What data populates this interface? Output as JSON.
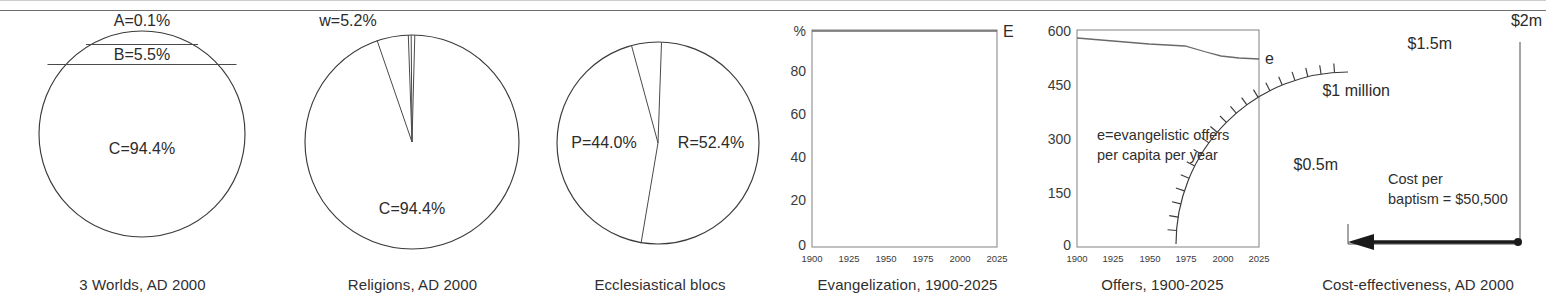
{
  "page": {
    "background": "#ffffff",
    "rule_color": "#6d6d6d",
    "ink_color": "#2b2b2b"
  },
  "panels": [
    {
      "id": "three-worlds",
      "caption": "3 Worlds, AD 2000",
      "labels": {
        "a": "A=0.1%",
        "b": "B=5.5%",
        "c": "C=94.4%"
      }
    },
    {
      "id": "religions",
      "caption": "Religions, AD 2000",
      "labels": {
        "w": "w=5.2%",
        "c": "C=94.4%"
      }
    },
    {
      "id": "ecclesiastical-blocs",
      "caption": "Ecclesiastical blocs",
      "labels": {
        "p": "P=44.0%",
        "r": "R=52.4%"
      }
    },
    {
      "id": "evangelization",
      "caption": "Evangelization, 1900-2025",
      "labels": {
        "unit": "%",
        "series": "E"
      }
    },
    {
      "id": "offers",
      "caption": "Offers, 1900-2025",
      "labels": {
        "series": "e",
        "note_line1": "e=evangelistic offers",
        "note_line2": "per capita per year"
      }
    },
    {
      "id": "cost-effectiveness",
      "caption": "Cost-effectiveness, AD 2000",
      "labels": {
        "t0_5m": "$0.5m",
        "t1m": "$1 million",
        "t1_5m": "$1.5m",
        "t2m": "$2m",
        "note_line1": "Cost per",
        "note_line2": "baptism = $50,500"
      }
    }
  ],
  "chart_data": [
    {
      "type": "pie",
      "id": "three-worlds",
      "title": "3 Worlds, AD 2000",
      "subtype": "circle-chords",
      "labels": [
        "A=0.1%",
        "B=5.5%",
        "C=94.4%"
      ],
      "categories": [
        "A",
        "B",
        "C"
      ],
      "values": [
        0.1,
        5.5,
        94.4
      ],
      "unit": "percent",
      "legend": "none"
    },
    {
      "type": "pie",
      "id": "religions",
      "title": "Religions, AD 2000",
      "labels": [
        "w=5.2%",
        "C=94.4%"
      ],
      "categories": [
        "w",
        "sliver",
        "C"
      ],
      "values": [
        5.2,
        0.4,
        94.4
      ],
      "unit": "percent",
      "legend": "none"
    },
    {
      "type": "pie",
      "id": "ecclesiastical-blocs",
      "title": "Ecclesiastical blocs",
      "labels": [
        "P=44.0%",
        "R=52.4%"
      ],
      "categories": [
        "R",
        "other",
        "P"
      ],
      "values": [
        52.4,
        3.6,
        44.0
      ],
      "unit": "percent",
      "legend": "none"
    },
    {
      "type": "line",
      "id": "evangelization",
      "title": "Evangelization, 1900-2025",
      "xlabel": "",
      "ylabel": "%",
      "xlim": [
        1900,
        2025
      ],
      "ylim": [
        0,
        100
      ],
      "xticks": [
        1900,
        1925,
        1950,
        1975,
        2000,
        2025
      ],
      "yticks": [
        0,
        20,
        40,
        60,
        80
      ],
      "grid": false,
      "legend": "inline-right",
      "series": [
        {
          "name": "E",
          "x": [
            1900,
            1925,
            1950,
            1975,
            2000,
            2025
          ],
          "values": [
            100,
            100,
            100,
            100,
            100,
            100
          ]
        }
      ]
    },
    {
      "type": "line",
      "id": "offers",
      "title": "Offers, 1900-2025",
      "xlabel": "",
      "ylabel": "",
      "xlim": [
        1900,
        2025
      ],
      "ylim": [
        0,
        600
      ],
      "xticks": [
        1900,
        1925,
        1950,
        1975,
        2000,
        2025
      ],
      "yticks": [
        0,
        150,
        300,
        450,
        600
      ],
      "grid": false,
      "legend": "inline-right",
      "annotation": "e=evangelistic offers per capita per year",
      "series": [
        {
          "name": "e",
          "x": [
            1900,
            1925,
            1950,
            1975,
            1990,
            2000,
            2012,
            2025
          ],
          "values": [
            578,
            570,
            562,
            556,
            538,
            528,
            524,
            520
          ]
        }
      ]
    },
    {
      "type": "bar",
      "id": "cost-effectiveness",
      "subtype": "gauge",
      "title": "Cost-effectiveness, AD 2000",
      "categories": [
        "$0.5m",
        "$1 million",
        "$1.5m",
        "$2m"
      ],
      "values": [
        500000,
        1000000,
        1500000,
        2000000
      ],
      "ylim": [
        0,
        2000000
      ],
      "needle_value": 50500,
      "annotation": "Cost per baptism = $50,500",
      "unit": "USD"
    }
  ]
}
